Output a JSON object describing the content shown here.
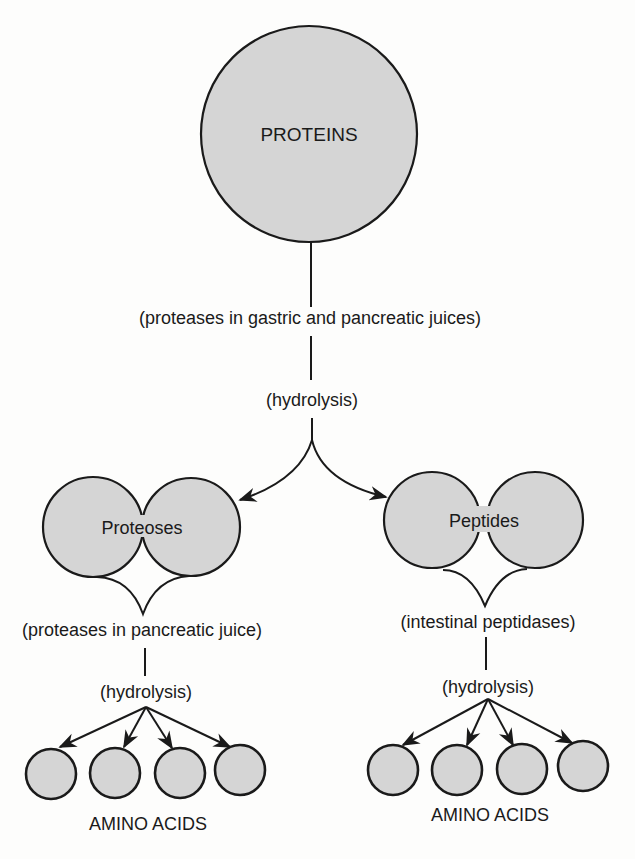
{
  "diagram": {
    "colors": {
      "node_fill": "#d5d5d5",
      "stroke": "#1a1a1a",
      "background": "#fdfdfc"
    },
    "top": {
      "node": {
        "label": "PROTEINS",
        "cx": 309,
        "cy": 134,
        "r": 108
      },
      "enzyme_label": "(proteases in gastric and pancreatic juices)",
      "process_label": "(hydrolysis)"
    },
    "branches": [
      {
        "id": "proteoses",
        "label": "Proteoses",
        "pair": [
          {
            "cx": 93,
            "cy": 527,
            "r": 50
          },
          {
            "cx": 191,
            "cy": 527,
            "r": 49
          }
        ],
        "enzyme_label": "(proteases in pancreatic juice)",
        "process_label": "(hydrolysis)",
        "products_label": "AMINO ACIDS",
        "products": [
          {
            "cx": 51,
            "cy": 774,
            "r": 25
          },
          {
            "cx": 115,
            "cy": 773,
            "r": 25
          },
          {
            "cx": 180,
            "cy": 773,
            "r": 25
          },
          {
            "cx": 240,
            "cy": 770,
            "r": 25
          }
        ]
      },
      {
        "id": "peptides",
        "label": "Peptides",
        "pair": [
          {
            "cx": 432,
            "cy": 520,
            "r": 48
          },
          {
            "cx": 535,
            "cy": 520,
            "r": 48
          }
        ],
        "enzyme_label": "(intestinal peptidases)",
        "process_label": "(hydrolysis)",
        "products_label": "AMINO ACIDS",
        "products": [
          {
            "cx": 393,
            "cy": 770,
            "r": 25
          },
          {
            "cx": 457,
            "cy": 770,
            "r": 25
          },
          {
            "cx": 522,
            "cy": 769,
            "r": 25
          },
          {
            "cx": 583,
            "cy": 766,
            "r": 25
          }
        ]
      }
    ]
  }
}
